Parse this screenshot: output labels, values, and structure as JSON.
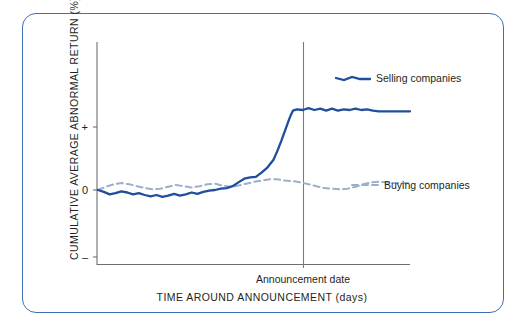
{
  "chart_data": {
    "type": "line",
    "title": "",
    "xlabel": "TIME AROUND ANNOUNCEMENT (days)",
    "ylabel": "CUMULATIVE AVERAGE ABNORMAL RETURN (%)",
    "ytick_labels": [
      "+",
      "0",
      "–"
    ],
    "ytick_values": [
      1,
      0,
      -1
    ],
    "ylim": [
      -1.35,
      1.6
    ],
    "xlim": [
      -100,
      60
    ],
    "xtick_labels": [],
    "grid": false,
    "legend_position": "right-inline",
    "annotations": [
      {
        "name": "announcement-date",
        "text": "Announcement date",
        "x": 0,
        "type": "vertical-line-label"
      }
    ],
    "series": [
      {
        "name": "Selling companies",
        "style": "solid",
        "color": "#1f4e9c",
        "x": [
          -100,
          -97,
          -94,
          -91,
          -88,
          -85,
          -82,
          -79,
          -76,
          -73,
          -70,
          -67,
          -64,
          -61,
          -58,
          -55,
          -52,
          -49,
          -46,
          -43,
          -40,
          -37,
          -34,
          -31,
          -28,
          -25,
          -22,
          -19,
          -16,
          -13,
          -10,
          -8,
          -6,
          -4,
          -2,
          -1,
          0,
          2,
          5,
          8,
          11,
          14,
          17,
          20,
          23,
          26,
          29,
          32,
          35,
          38,
          41,
          44,
          47,
          50,
          53,
          56,
          60
        ],
        "y": [
          0.0,
          -0.03,
          -0.07,
          -0.05,
          -0.02,
          -0.04,
          -0.07,
          -0.05,
          -0.08,
          -0.1,
          -0.08,
          -0.11,
          -0.09,
          -0.06,
          -0.09,
          -0.07,
          -0.04,
          -0.06,
          -0.03,
          -0.01,
          0.0,
          0.02,
          0.03,
          0.06,
          0.12,
          0.18,
          0.2,
          0.21,
          0.28,
          0.36,
          0.48,
          0.62,
          0.78,
          0.95,
          1.12,
          1.2,
          1.26,
          1.28,
          1.27,
          1.3,
          1.27,
          1.29,
          1.26,
          1.29,
          1.26,
          1.28,
          1.27,
          1.29,
          1.27,
          1.28,
          1.26,
          1.25,
          1.25,
          1.25,
          1.25,
          1.25,
          1.25
        ]
      },
      {
        "name": "Buying companies",
        "style": "dashed",
        "color": "#9bb0cc",
        "x": [
          -100,
          -96,
          -92,
          -88,
          -84,
          -80,
          -76,
          -72,
          -68,
          -64,
          -60,
          -56,
          -52,
          -48,
          -44,
          -40,
          -36,
          -32,
          -28,
          -24,
          -20,
          -16,
          -12,
          -8,
          -4,
          0,
          4,
          8,
          12,
          16,
          20,
          24,
          28,
          32,
          36,
          40,
          44,
          48,
          52,
          56,
          60
        ],
        "y": [
          0.0,
          0.05,
          0.09,
          0.11,
          0.09,
          0.06,
          0.03,
          0.01,
          0.02,
          0.05,
          0.08,
          0.06,
          0.04,
          0.06,
          0.09,
          0.1,
          0.07,
          0.05,
          0.07,
          0.1,
          0.13,
          0.15,
          0.17,
          0.17,
          0.15,
          0.14,
          0.12,
          0.09,
          0.06,
          0.03,
          0.02,
          0.01,
          0.02,
          0.05,
          0.09,
          0.12,
          0.13,
          0.12,
          0.11,
          0.11,
          0.11
        ]
      }
    ]
  },
  "legend": {
    "selling_label": "Selling companies",
    "buying_label": "Buying companies"
  },
  "axes": {
    "y_axis_label": "CUMULATIVE AVERAGE ABNORMAL RETURN (%)",
    "x_axis_label": "TIME AROUND ANNOUNCEMENT (days)",
    "ytick_plus": "+",
    "ytick_zero": "0",
    "ytick_minus": "–"
  },
  "annotation": {
    "announcement_date": "Announcement date"
  },
  "colors": {
    "selling_line": "#1f4e9c",
    "buying_line": "#9bb0cc",
    "frame_border": "#3f6fb5",
    "axis": "#6f6f6f",
    "text": "#231f20"
  }
}
